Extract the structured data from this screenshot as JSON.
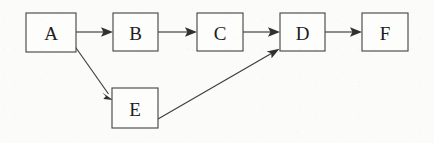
{
  "diagram": {
    "type": "directed-graph",
    "title": "",
    "background_color": "#fbfbfa",
    "node_fill_color": "#fdfdfc",
    "node_border_color": "#4a4a4c",
    "edge_color": "#3c3c3e",
    "label_color": "#202022",
    "nodes": [
      {
        "id": "A",
        "label": "A",
        "x": 26,
        "y": 13,
        "w": 50,
        "h": 39
      },
      {
        "id": "B",
        "label": "B",
        "x": 113,
        "y": 13,
        "w": 45,
        "h": 38
      },
      {
        "id": "C",
        "label": "C",
        "x": 197,
        "y": 13,
        "w": 46,
        "h": 38
      },
      {
        "id": "D",
        "label": "D",
        "x": 280,
        "y": 13,
        "w": 45,
        "h": 38
      },
      {
        "id": "F",
        "label": "F",
        "x": 362,
        "y": 13,
        "w": 46,
        "h": 38
      },
      {
        "id": "E",
        "label": "E",
        "x": 112,
        "y": 88,
        "w": 46,
        "h": 40
      }
    ],
    "edges": [
      {
        "id": "A-B",
        "from": "A",
        "to": "B",
        "x1": 76,
        "y1": 32,
        "x2": 113,
        "y2": 32,
        "directed": true
      },
      {
        "id": "B-C",
        "from": "B",
        "to": "C",
        "x1": 158,
        "y1": 32,
        "x2": 197,
        "y2": 32,
        "directed": true
      },
      {
        "id": "C-D",
        "from": "C",
        "to": "D",
        "x1": 243,
        "y1": 32,
        "x2": 280,
        "y2": 32,
        "directed": true
      },
      {
        "id": "D-F",
        "from": "D",
        "to": "F",
        "x1": 325,
        "y1": 32,
        "x2": 362,
        "y2": 32,
        "directed": true
      },
      {
        "id": "A-E",
        "from": "A",
        "to": "E",
        "x1": 74,
        "y1": 45,
        "x2": 113,
        "y2": 100,
        "directed": true
      },
      {
        "id": "E-D",
        "from": "E",
        "to": "D",
        "x1": 158,
        "y1": 119,
        "x2": 279,
        "y2": 49,
        "directed": true
      }
    ]
  }
}
